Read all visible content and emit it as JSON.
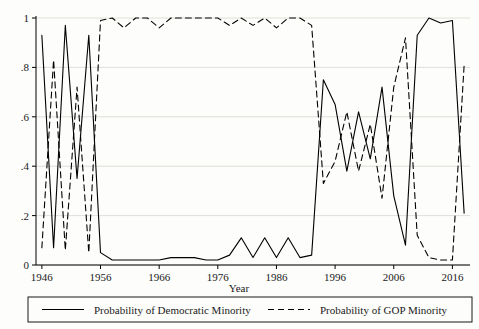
{
  "chart_data": {
    "type": "line",
    "title": "",
    "xlabel": "Year",
    "ylabel": "",
    "xlim": [
      1945,
      2019
    ],
    "ylim": [
      0,
      1
    ],
    "grid": "horizontal",
    "legend_position": "bottom",
    "x_ticks": [
      1946,
      1956,
      1966,
      1976,
      1986,
      1996,
      2006,
      2016
    ],
    "x_tick_labels": [
      "1946",
      "1956",
      "1966",
      "1976",
      "1986",
      "1996",
      "2006",
      "2016"
    ],
    "y_ticks": [
      0,
      0.2,
      0.4,
      0.6,
      0.8,
      1
    ],
    "y_tick_labels": [
      "0",
      ".2",
      ".4",
      ".6",
      ".8",
      "1"
    ],
    "series": [
      {
        "name": "Probability of Democratic Minority",
        "style": "solid",
        "color": "#000000",
        "x": [
          1946,
          1948,
          1950,
          1952,
          1954,
          1956,
          1958,
          1960,
          1962,
          1964,
          1966,
          1968,
          1970,
          1972,
          1974,
          1976,
          1978,
          1980,
          1982,
          1984,
          1986,
          1988,
          1990,
          1992,
          1994,
          1996,
          1998,
          2000,
          2002,
          2004,
          2006,
          2008,
          2010,
          2012,
          2014,
          2016,
          2018
        ],
        "values": [
          0.93,
          0.07,
          0.97,
          0.35,
          0.93,
          0.05,
          0.02,
          0.02,
          0.02,
          0.02,
          0.02,
          0.03,
          0.03,
          0.03,
          0.02,
          0.02,
          0.04,
          0.11,
          0.03,
          0.11,
          0.03,
          0.11,
          0.03,
          0.04,
          0.75,
          0.65,
          0.38,
          0.62,
          0.43,
          0.72,
          0.28,
          0.08,
          0.93,
          1.0,
          0.98,
          0.99,
          0.21
        ]
      },
      {
        "name": "Probability of GOP Minority",
        "style": "dashed",
        "color": "#000000",
        "x": [
          1946,
          1948,
          1950,
          1952,
          1954,
          1956,
          1958,
          1960,
          1962,
          1964,
          1966,
          1968,
          1970,
          1972,
          1974,
          1976,
          1978,
          1980,
          1982,
          1984,
          1986,
          1988,
          1990,
          1992,
          1994,
          1996,
          1998,
          2000,
          2002,
          2004,
          2006,
          2008,
          2010,
          2012,
          2014,
          2016,
          2018
        ],
        "values": [
          0.07,
          0.83,
          0.06,
          0.72,
          0.05,
          0.99,
          1.0,
          0.96,
          1.0,
          1.0,
          0.96,
          1.0,
          1.0,
          1.0,
          1.0,
          1.0,
          0.97,
          1.0,
          0.97,
          1.0,
          0.96,
          1.0,
          1.0,
          0.97,
          0.33,
          0.42,
          0.62,
          0.38,
          0.57,
          0.27,
          0.72,
          0.92,
          0.12,
          0.03,
          0.02,
          0.02,
          0.81
        ]
      }
    ]
  },
  "legend": {
    "items": [
      {
        "label": "Probability of Democratic Minority",
        "style": "solid"
      },
      {
        "label": "Probability of GOP Minority",
        "style": "dashed"
      }
    ]
  },
  "axes": {
    "x_title": "Year"
  }
}
